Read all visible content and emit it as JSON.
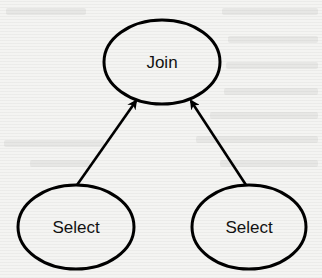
{
  "diagram": {
    "type": "query-plan-tree",
    "colors": {
      "background": "#f4f4f2",
      "stroke": "#000000",
      "text": "#111111"
    },
    "nodes": [
      {
        "id": "join",
        "label": "Join",
        "cx": 162,
        "cy": 62,
        "rx": 58,
        "ry": 42
      },
      {
        "id": "select-left",
        "label": "Select",
        "cx": 76,
        "cy": 227,
        "rx": 58,
        "ry": 42
      },
      {
        "id": "select-right",
        "label": "Select",
        "cx": 249,
        "cy": 227,
        "rx": 57,
        "ry": 42
      }
    ],
    "edges": [
      {
        "from": "select-left",
        "to": "join",
        "x1": 77,
        "y1": 185,
        "x2": 136,
        "y2": 101,
        "arrow": "end"
      },
      {
        "from": "select-right",
        "to": "join",
        "x1": 246,
        "y1": 185,
        "x2": 191,
        "y2": 101,
        "arrow": "end"
      }
    ]
  }
}
